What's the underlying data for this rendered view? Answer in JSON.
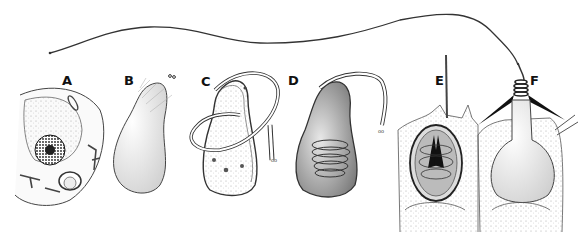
{
  "figure": {
    "panels": [
      {
        "id": "A",
        "label": "A",
        "subject": "cnidoblast cell with nucleus and organelles"
      },
      {
        "id": "B",
        "label": "B",
        "subject": "developing capsule"
      },
      {
        "id": "C",
        "label": "C",
        "subject": "capsule with external tubule forming"
      },
      {
        "id": "D",
        "label": "D",
        "subject": "tubule invaginating and coiling inside capsule"
      },
      {
        "id": "E",
        "label": "E",
        "subject": "mature nematocyst with coiled thread and stylets in cell"
      },
      {
        "id": "F",
        "label": "F",
        "subject": "discharged nematocyst with everted thread and barbs"
      }
    ],
    "colors": {
      "background": "#ffffff",
      "ink": "#1a1a1a",
      "stipple": "#888888",
      "fill_light": "#f2f2f2"
    }
  }
}
